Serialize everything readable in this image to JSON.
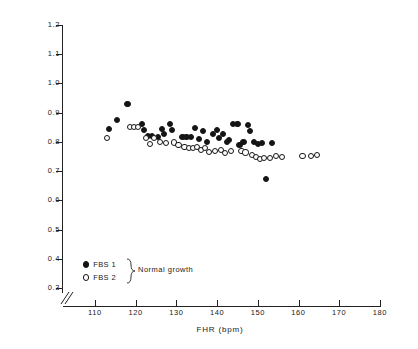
{
  "chart_data": {
    "type": "scatter",
    "title": "",
    "xlabel": "FHR (bpm)",
    "ylabel": "mean PI UA",
    "xlim": [
      105,
      182
    ],
    "ylim": [
      0.3,
      1.65
    ],
    "grid": false,
    "axis_break": "x and y axes broken near origin",
    "xticks": [
      110,
      120,
      130,
      140,
      150,
      160,
      170,
      180
    ],
    "xtick_labels": [
      "110",
      "120",
      "130",
      "140",
      "150",
      "160",
      "170",
      "180"
    ],
    "yticks": [
      0.3,
      0.4,
      0.5,
      0.6,
      0.7,
      0.8,
      0.9,
      1.0,
      1.1,
      1.2,
      1.3,
      1.4,
      1.5,
      1.6
    ],
    "ytick_labels": [
      "0.3",
      "0.4",
      "0.5",
      "0.6",
      "0.7",
      "0.8",
      "0.9",
      "1.0",
      "1.1",
      "1.2",
      "1.3",
      "1.4",
      "1.5",
      "1.6"
    ],
    "legend": {
      "position": "lower-left-inside",
      "group_label": "Normal growth",
      "entries": [
        {
          "name": "FBS 1",
          "marker": "filled-circle",
          "color": "#151515"
        },
        {
          "name": "FBS 2",
          "marker": "open-circle",
          "color": "#151515"
        }
      ]
    },
    "series": [
      {
        "name": "FBS 1",
        "marker": "filled-circle",
        "points": [
          [
            113.5,
            0.845
          ],
          [
            115.5,
            0.875
          ],
          [
            118.0,
            0.93
          ],
          [
            121.5,
            0.86
          ],
          [
            122.0,
            0.84
          ],
          [
            123.0,
            0.82
          ],
          [
            124.0,
            0.82
          ],
          [
            125.5,
            0.818
          ],
          [
            126.5,
            0.845
          ],
          [
            127.0,
            0.828
          ],
          [
            128.5,
            0.862
          ],
          [
            129.0,
            0.84
          ],
          [
            131.5,
            0.818
          ],
          [
            132.5,
            0.818
          ],
          [
            133.5,
            0.816
          ],
          [
            134.5,
            0.848
          ],
          [
            135.5,
            0.81
          ],
          [
            136.5,
            0.838
          ],
          [
            137.5,
            0.8
          ],
          [
            139.0,
            0.826
          ],
          [
            140.0,
            0.842
          ],
          [
            140.5,
            0.812
          ],
          [
            141.5,
            0.828
          ],
          [
            142.5,
            0.8
          ],
          [
            143.0,
            0.806
          ],
          [
            144.0,
            0.862
          ],
          [
            145.0,
            0.862
          ],
          [
            145.5,
            0.79
          ],
          [
            146.5,
            0.8
          ],
          [
            147.5,
            0.858
          ],
          [
            148.0,
            0.838
          ],
          [
            149.0,
            0.8
          ],
          [
            150.0,
            0.792
          ],
          [
            151.0,
            0.796
          ],
          [
            152.0,
            0.672
          ],
          [
            153.5,
            0.796
          ]
        ]
      },
      {
        "name": "FBS 2",
        "marker": "open-circle",
        "points": [
          [
            113.0,
            0.812
          ],
          [
            118.5,
            0.85
          ],
          [
            119.5,
            0.852
          ],
          [
            120.5,
            0.852
          ],
          [
            122.5,
            0.812
          ],
          [
            123.5,
            0.792
          ],
          [
            124.5,
            0.812
          ],
          [
            126.0,
            0.8
          ],
          [
            127.5,
            0.796
          ],
          [
            129.5,
            0.798
          ],
          [
            130.5,
            0.79
          ],
          [
            132.0,
            0.782
          ],
          [
            133.0,
            0.78
          ],
          [
            134.0,
            0.778
          ],
          [
            135.0,
            0.782
          ],
          [
            136.0,
            0.772
          ],
          [
            137.0,
            0.778
          ],
          [
            138.0,
            0.766
          ],
          [
            139.5,
            0.768
          ],
          [
            141.0,
            0.772
          ],
          [
            142.0,
            0.762
          ],
          [
            143.5,
            0.77
          ],
          [
            146.0,
            0.768
          ],
          [
            147.0,
            0.764
          ],
          [
            148.5,
            0.756
          ],
          [
            149.5,
            0.748
          ],
          [
            150.5,
            0.742
          ],
          [
            151.5,
            0.746
          ],
          [
            153.0,
            0.744
          ],
          [
            154.5,
            0.752
          ],
          [
            156.0,
            0.748
          ],
          [
            161.0,
            0.752
          ],
          [
            163.0,
            0.752
          ],
          [
            164.5,
            0.754
          ]
        ]
      }
    ]
  }
}
